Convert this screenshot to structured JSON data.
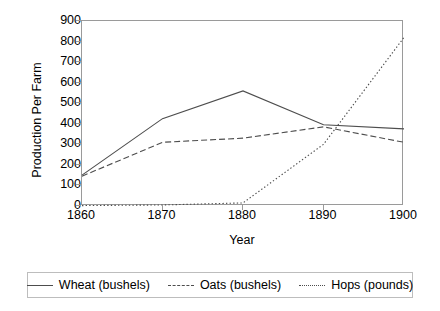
{
  "chart_data": {
    "type": "line",
    "title": "",
    "xlabel": "Year",
    "ylabel": "Production Per Farm",
    "x": [
      1860,
      1870,
      1880,
      1890,
      1900
    ],
    "xtick_labels": [
      "1860",
      "1870",
      "1880",
      "1890",
      "1900"
    ],
    "ytick_labels": [
      "0",
      "100",
      "200",
      "300",
      "400",
      "500",
      "600",
      "700",
      "800",
      "900"
    ],
    "yticks": [
      0,
      100,
      200,
      300,
      400,
      500,
      600,
      700,
      800,
      900
    ],
    "ylim": [
      0,
      900
    ],
    "xlim": [
      1860,
      1900
    ],
    "grid": false,
    "legend_position": "bottom",
    "series": [
      {
        "name": "Wheat (bushels)",
        "style": "solid",
        "color": "#4d4d4d",
        "values": [
          150,
          425,
          560,
          395,
          375
        ]
      },
      {
        "name": "Oats (bushels)",
        "style": "dashed",
        "color": "#4d4d4d",
        "values": [
          145,
          310,
          330,
          385,
          310
        ]
      },
      {
        "name": "Hops (pounds)",
        "style": "dotted",
        "color": "#4d4d4d",
        "values": [
          2,
          5,
          15,
          300,
          820
        ]
      }
    ]
  }
}
